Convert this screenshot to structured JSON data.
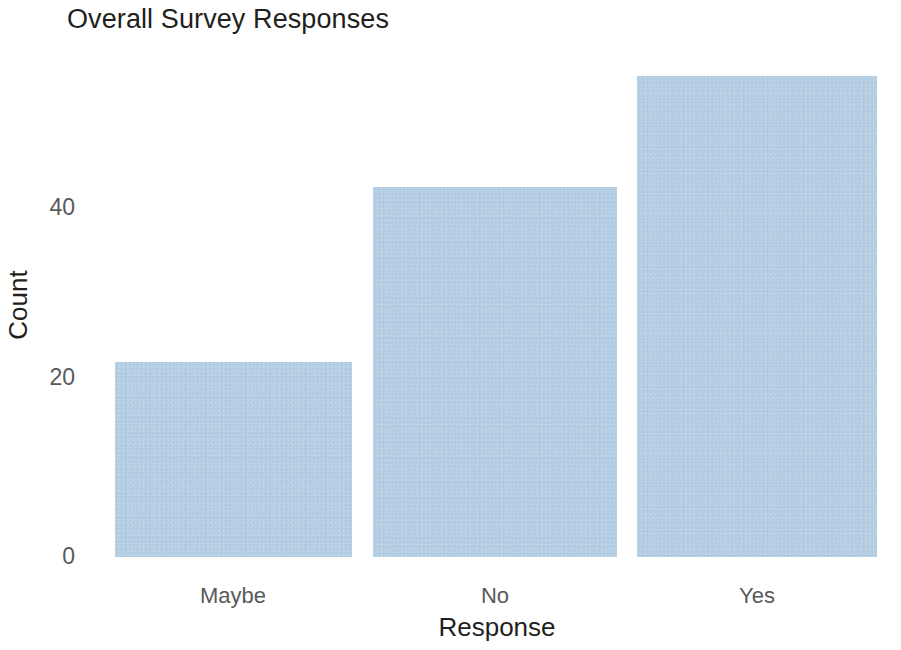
{
  "chart_data": {
    "type": "bar",
    "title": "Overall Survey Responses",
    "xlabel": "Response",
    "ylabel": "Count",
    "categories": [
      "Maybe",
      "No",
      "Yes"
    ],
    "values": [
      22,
      42,
      55
    ],
    "series": [
      {
        "name": "Count",
        "values": [
          22,
          42,
          55
        ]
      }
    ],
    "ytick_labels": [
      "0",
      "20",
      "40"
    ],
    "ytick_values": [
      0,
      20,
      40
    ],
    "ylim": [
      0,
      55
    ],
    "grid": false,
    "legend": false,
    "legend_position": "none",
    "bar_color": "#b3cde3",
    "background_color": "#ffffff",
    "title_color": "#231f20",
    "tick_color": "#58595b",
    "axis_label_color": "#231f20"
  },
  "bars": [
    {
      "label": "Maybe",
      "value": 22,
      "left": 115,
      "width": 237,
      "top": 362,
      "height": 195
    },
    {
      "label": "No",
      "value": 42,
      "left": 373,
      "width": 244,
      "top": 187,
      "height": 370
    },
    {
      "label": "Yes",
      "value": 55,
      "left": 637,
      "width": 240,
      "top": 76,
      "height": 481
    }
  ],
  "y_ticks": [
    {
      "label": "0",
      "top": 545
    },
    {
      "label": "20",
      "top": 366
    },
    {
      "label": "40",
      "top": 196
    }
  ],
  "x_ticks": [
    {
      "label": "Maybe",
      "left": 233,
      "top": 585
    },
    {
      "label": "No",
      "left": 495,
      "top": 585
    },
    {
      "label": "Yes",
      "left": 757,
      "top": 585
    }
  ]
}
